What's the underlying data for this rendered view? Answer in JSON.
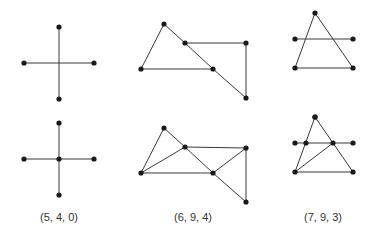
{
  "figure": {
    "captions": [
      {
        "id": "col1",
        "text": "(5, 4, 0)",
        "x": 59
      },
      {
        "id": "col2",
        "text": "(6, 9, 4)",
        "x": 193
      },
      {
        "id": "col3",
        "text": "(7, 9, 3)",
        "x": 323
      }
    ],
    "graphs": [
      {
        "id": "col1-top",
        "vertices": [
          [
            59,
            27
          ],
          [
            24,
            63
          ],
          [
            94,
            63
          ],
          [
            59,
            99
          ]
        ],
        "edges": [
          [
            0,
            3
          ],
          [
            1,
            2
          ]
        ]
      },
      {
        "id": "col1-bottom",
        "vertices": [
          [
            59,
            123
          ],
          [
            24,
            159
          ],
          [
            59,
            159
          ],
          [
            94,
            159
          ],
          [
            59,
            195
          ]
        ],
        "edges": [
          [
            0,
            2
          ],
          [
            2,
            4
          ],
          [
            1,
            2
          ],
          [
            2,
            3
          ]
        ]
      },
      {
        "id": "col2-top",
        "vertices": [
          [
            164,
            24
          ],
          [
            185,
            43
          ],
          [
            141,
            69
          ],
          [
            213,
            69
          ],
          [
            246,
            43
          ],
          [
            246,
            98
          ]
        ],
        "edges": [
          [
            0,
            2
          ],
          [
            0,
            1
          ],
          [
            1,
            3
          ],
          [
            3,
            5
          ],
          [
            2,
            3
          ],
          [
            1,
            4
          ],
          [
            4,
            5
          ]
        ]
      },
      {
        "id": "col2-bottom",
        "vertices": [
          [
            164,
            128
          ],
          [
            185,
            147
          ],
          [
            141,
            173
          ],
          [
            213,
            173
          ],
          [
            246,
            148
          ],
          [
            246,
            202
          ]
        ],
        "edges": [
          [
            0,
            2
          ],
          [
            0,
            1
          ],
          [
            1,
            2
          ],
          [
            1,
            4
          ],
          [
            1,
            3
          ],
          [
            2,
            3
          ],
          [
            3,
            4
          ],
          [
            3,
            5
          ],
          [
            4,
            5
          ]
        ]
      },
      {
        "id": "col3-top",
        "vertices": [
          [
            315,
            13
          ],
          [
            295,
            39
          ],
          [
            353,
            39
          ],
          [
            295,
            68
          ],
          [
            353,
            68
          ],
          [
            315,
            117
          ]
        ],
        "edges": [
          [
            0,
            3
          ],
          [
            0,
            4
          ],
          [
            1,
            2
          ],
          [
            3,
            4
          ]
        ]
      },
      {
        "id": "col3-bottom",
        "vertices": [
          [
            315,
            117
          ],
          [
            295,
            143
          ],
          [
            306,
            143
          ],
          [
            333,
            143
          ],
          [
            353,
            143
          ],
          [
            295,
            172
          ],
          [
            353,
            172
          ]
        ],
        "edges": [
          [
            0,
            5
          ],
          [
            0,
            6
          ],
          [
            1,
            4
          ],
          [
            5,
            6
          ],
          [
            5,
            3
          ]
        ]
      }
    ]
  },
  "colors": {
    "edge": "#3a3a3a",
    "vertex": "#1a1a1a",
    "text": "#333333",
    "background": "#ffffff"
  }
}
